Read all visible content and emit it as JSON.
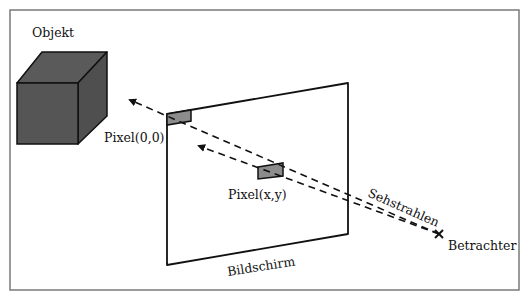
{
  "diagram": {
    "type": "ray-casting illustration",
    "labels": {
      "object": "Objekt",
      "pixel_origin": "Pixel(0,0)",
      "pixel_xy": "Pixel(x,y)",
      "screen": "Bildschirm",
      "rays": "Sehstrahlen",
      "viewer": "Betrachter"
    },
    "colors": {
      "frame": "#7a7a7a",
      "cube_fill": "#555555",
      "pixel_fill": "#8c8c8c",
      "stroke": "#111111"
    }
  }
}
